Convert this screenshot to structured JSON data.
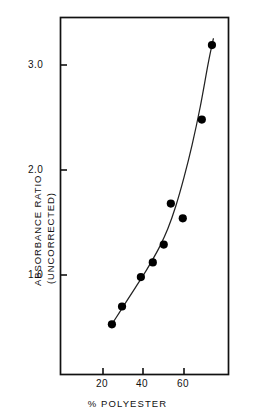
{
  "chart_data": {
    "type": "scatter",
    "title": "",
    "xlabel": "% POLYESTER",
    "ylabel": "ABSORBANCE RATIO (UNCORRECTED)",
    "ylabel_lines": [
      "ABSORBANCE  RATIO",
      "(UNCORRECTED)"
    ],
    "xlim": [
      10,
      82
    ],
    "ylim": [
      0.28,
      3.45
    ],
    "xticks": [
      20,
      40,
      60
    ],
    "yticks": [
      1.0,
      2.0,
      3.0
    ],
    "xtick_labels": [
      "20",
      "40",
      "60"
    ],
    "ytick_labels": [
      "1.0",
      "2.0",
      "3.0"
    ],
    "grid": false,
    "legend": "none",
    "frame": "box",
    "marker": "filled-circle",
    "marker_color": "#000000",
    "line_color": "#222222",
    "x": [
      24.4,
      29.4,
      38.7,
      44.6,
      50.0,
      53.5,
      59.4,
      68.8,
      73.8
    ],
    "y": [
      0.53,
      0.7,
      0.98,
      1.12,
      1.29,
      1.68,
      1.54,
      2.48,
      3.19
    ],
    "points": [
      {
        "x": 24.4,
        "y": 0.53
      },
      {
        "x": 29.4,
        "y": 0.7
      },
      {
        "x": 38.7,
        "y": 0.98
      },
      {
        "x": 44.6,
        "y": 1.12
      },
      {
        "x": 50.0,
        "y": 1.29
      },
      {
        "x": 53.5,
        "y": 1.68
      },
      {
        "x": 59.4,
        "y": 1.54
      },
      {
        "x": 68.8,
        "y": 2.48
      },
      {
        "x": 73.8,
        "y": 3.19
      }
    ],
    "fit_curve": {
      "description": "smooth monotonic increasing trend line through points",
      "x": [
        24.0,
        28.0,
        32.0,
        36.0,
        40.0,
        44.0,
        48.0,
        52.0,
        56.0,
        60.0,
        64.0,
        68.0,
        72.0,
        74.5
      ],
      "y": [
        0.52,
        0.64,
        0.76,
        0.88,
        1.0,
        1.13,
        1.27,
        1.44,
        1.66,
        1.93,
        2.24,
        2.6,
        3.02,
        3.25
      ]
    }
  },
  "axes": {
    "xtick_labels": [
      "20",
      "40",
      "60"
    ],
    "ytick_labels": [
      "1.0",
      "2.0",
      "3.0"
    ],
    "xlabel": "% POLYESTER",
    "ylabel_line1": "ABSORBANCE  RATIO",
    "ylabel_line2": "(UNCORRECTED)"
  }
}
